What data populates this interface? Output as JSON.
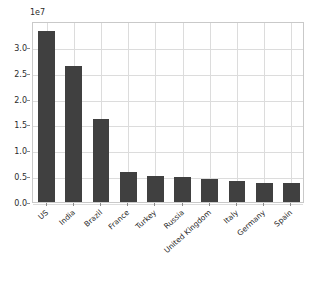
{
  "chart_data": {
    "type": "bar",
    "title": "",
    "xlabel": "",
    "ylabel": "",
    "offset_label": "1e7",
    "categories": [
      "US",
      "India",
      "Brazil",
      "France",
      "Turkey",
      "Russia",
      "United Kingdom",
      "Italy",
      "Germany",
      "Spain"
    ],
    "values": [
      33000000,
      26300000,
      16100000,
      5900000,
      5100000,
      4850000,
      4450000,
      4100000,
      3700000,
      3700000
    ],
    "ylim": [
      0,
      35000000
    ],
    "ytick_values": [
      0,
      5000000,
      10000000,
      15000000,
      20000000,
      25000000,
      30000000
    ],
    "ytick_labels": [
      "0.0",
      "0.5",
      "1.0",
      "1.5",
      "2.0",
      "2.5",
      "3.0"
    ],
    "grid": true,
    "legend": "none",
    "bar_color": "#404040",
    "grid_color": "#dcdcdc",
    "axes_color": "#c9c9c9",
    "text_color": "#2b2b2b",
    "background_color": "#ffffff"
  }
}
